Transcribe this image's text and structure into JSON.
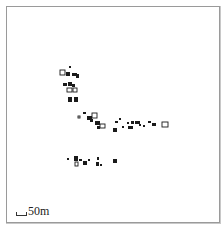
{
  "map": {
    "type": "settlement-plan",
    "frame": {
      "x": 6,
      "y": 6,
      "width": 214,
      "height": 217,
      "border_color": "#9a9a9a"
    },
    "feature_color": "#1a1a1a",
    "clusters": [
      {
        "name": "north-column",
        "buildings": [
          {
            "x": 69,
            "y": 66,
            "w": 2,
            "h": 2,
            "shape": "dot"
          },
          {
            "x": 60,
            "y": 70,
            "w": 5,
            "h": 5,
            "shape": "outlined"
          },
          {
            "x": 66,
            "y": 72,
            "w": 4,
            "h": 4,
            "shape": "filled"
          },
          {
            "x": 72,
            "y": 73,
            "w": 5,
            "h": 3,
            "shape": "filled"
          },
          {
            "x": 76,
            "y": 74,
            "w": 3,
            "h": 4,
            "shape": "filled"
          },
          {
            "x": 63,
            "y": 83,
            "w": 4,
            "h": 3,
            "shape": "filled"
          },
          {
            "x": 68,
            "y": 82,
            "w": 4,
            "h": 4,
            "shape": "filled"
          },
          {
            "x": 72,
            "y": 84,
            "w": 3,
            "h": 3,
            "shape": "filled"
          },
          {
            "x": 67,
            "y": 88,
            "w": 5,
            "h": 4,
            "shape": "outlined"
          },
          {
            "x": 73,
            "y": 88,
            "w": 4,
            "h": 4,
            "shape": "outlined"
          },
          {
            "x": 68,
            "y": 97,
            "w": 4,
            "h": 5,
            "shape": "filled"
          },
          {
            "x": 74,
            "y": 97,
            "w": 4,
            "h": 5,
            "shape": "filled"
          }
        ]
      },
      {
        "name": "central-band",
        "buildings": [
          {
            "x": 78,
            "y": 116,
            "w": 2,
            "h": 2,
            "shape": "outlined"
          },
          {
            "x": 83,
            "y": 112,
            "w": 3,
            "h": 2,
            "shape": "filled"
          },
          {
            "x": 87,
            "y": 116,
            "w": 5,
            "h": 4,
            "shape": "filled"
          },
          {
            "x": 92,
            "y": 113,
            "w": 5,
            "h": 5,
            "shape": "outlined"
          },
          {
            "x": 90,
            "y": 119,
            "w": 3,
            "h": 3,
            "shape": "filled"
          },
          {
            "x": 95,
            "y": 121,
            "w": 5,
            "h": 4,
            "shape": "filled"
          },
          {
            "x": 100,
            "y": 124,
            "w": 5,
            "h": 4,
            "shape": "outlined"
          },
          {
            "x": 97,
            "y": 126,
            "w": 3,
            "h": 3,
            "shape": "filled"
          },
          {
            "x": 113,
            "y": 128,
            "w": 4,
            "h": 4,
            "shape": "filled"
          },
          {
            "x": 115,
            "y": 121,
            "w": 3,
            "h": 2,
            "shape": "filled"
          },
          {
            "x": 119,
            "y": 118,
            "w": 2,
            "h": 2,
            "shape": "filled"
          },
          {
            "x": 122,
            "y": 126,
            "w": 2,
            "h": 2,
            "shape": "filled"
          },
          {
            "x": 127,
            "y": 122,
            "w": 2,
            "h": 2,
            "shape": "filled"
          },
          {
            "x": 128,
            "y": 126,
            "w": 5,
            "h": 3,
            "shape": "filled"
          },
          {
            "x": 131,
            "y": 121,
            "w": 3,
            "h": 3,
            "shape": "filled"
          },
          {
            "x": 135,
            "y": 121,
            "w": 5,
            "h": 3,
            "shape": "filled"
          },
          {
            "x": 139,
            "y": 124,
            "w": 2,
            "h": 2,
            "shape": "filled"
          },
          {
            "x": 143,
            "y": 125,
            "w": 2,
            "h": 2,
            "shape": "filled"
          },
          {
            "x": 148,
            "y": 121,
            "w": 3,
            "h": 2,
            "shape": "filled"
          },
          {
            "x": 152,
            "y": 123,
            "w": 4,
            "h": 3,
            "shape": "filled"
          },
          {
            "x": 162,
            "y": 122,
            "w": 6,
            "h": 5,
            "shape": "outlined"
          }
        ]
      },
      {
        "name": "south-row",
        "buildings": [
          {
            "x": 67,
            "y": 158,
            "w": 2,
            "h": 2,
            "shape": "filled"
          },
          {
            "x": 74,
            "y": 156,
            "w": 4,
            "h": 5,
            "shape": "filled"
          },
          {
            "x": 75,
            "y": 162,
            "w": 3,
            "h": 4,
            "shape": "outlined"
          },
          {
            "x": 79,
            "y": 159,
            "w": 3,
            "h": 2,
            "shape": "filled"
          },
          {
            "x": 83,
            "y": 161,
            "w": 4,
            "h": 4,
            "shape": "filled"
          },
          {
            "x": 88,
            "y": 159,
            "w": 2,
            "h": 2,
            "shape": "filled"
          },
          {
            "x": 97,
            "y": 157,
            "w": 2,
            "h": 3,
            "shape": "filled"
          },
          {
            "x": 96,
            "y": 162,
            "w": 3,
            "h": 4,
            "shape": "filled"
          },
          {
            "x": 100,
            "y": 164,
            "w": 2,
            "h": 2,
            "shape": "filled"
          },
          {
            "x": 113,
            "y": 159,
            "w": 4,
            "h": 4,
            "shape": "filled"
          }
        ]
      }
    ],
    "scale_bar": {
      "label": "50m",
      "length_px": 11
    }
  }
}
